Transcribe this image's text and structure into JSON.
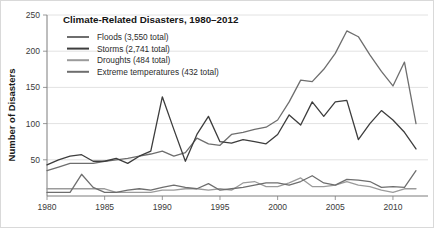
{
  "chart_data": {
    "type": "line",
    "title": "Climate-Related Disasters, 1980–2012",
    "xlabel": "",
    "ylabel": "Number of Disasters",
    "xlim": [
      1980,
      2012
    ],
    "ylim": [
      0,
      250
    ],
    "grid": true,
    "legend_position": "top-left",
    "x": [
      1980,
      1981,
      1982,
      1983,
      1984,
      1985,
      1986,
      1987,
      1988,
      1989,
      1990,
      1991,
      1992,
      1993,
      1994,
      1995,
      1996,
      1997,
      1998,
      1999,
      2000,
      2001,
      2002,
      2003,
      2004,
      2005,
      2006,
      2007,
      2008,
      2009,
      2010,
      2011,
      2012
    ],
    "x_ticks": [
      1980,
      1985,
      1990,
      1995,
      2000,
      2005,
      2010
    ],
    "y_ticks": [
      50,
      100,
      150,
      200,
      250
    ],
    "series": [
      {
        "name": "Floods",
        "label": "Floods (3,550 total)",
        "total": "3,550",
        "color": "#6e6e6e",
        "values": [
          35,
          40,
          45,
          45,
          45,
          48,
          50,
          52,
          55,
          58,
          62,
          55,
          60,
          80,
          72,
          70,
          85,
          88,
          92,
          95,
          105,
          130,
          160,
          158,
          175,
          197,
          228,
          220,
          195,
          172,
          152,
          185,
          100
        ]
      },
      {
        "name": "Storms",
        "label": "Storms (2,741 total)",
        "total": "2,741",
        "color": "#3d3d3d",
        "values": [
          43,
          50,
          55,
          57,
          48,
          48,
          52,
          45,
          55,
          62,
          137,
          92,
          48,
          85,
          110,
          75,
          73,
          78,
          75,
          72,
          85,
          112,
          98,
          130,
          110,
          130,
          132,
          78,
          100,
          118,
          105,
          88,
          65
        ]
      },
      {
        "name": "Droughts",
        "label": "Droughts (484 total)",
        "total": "484",
        "color": "#9b9b9b",
        "values": [
          10,
          10,
          10,
          10,
          10,
          10,
          5,
          5,
          5,
          5,
          8,
          8,
          10,
          10,
          8,
          10,
          8,
          18,
          20,
          13,
          13,
          18,
          25,
          13,
          13,
          15,
          20,
          15,
          13,
          8,
          5,
          10,
          10
        ]
      },
      {
        "name": "Extreme temperatures",
        "label": "Extreme temperatures (432 total)",
        "total": "432",
        "color": "#6e6e6e",
        "values": [
          5,
          5,
          5,
          30,
          12,
          5,
          5,
          8,
          10,
          8,
          12,
          15,
          12,
          10,
          17,
          8,
          10,
          12,
          15,
          18,
          18,
          15,
          20,
          28,
          18,
          15,
          23,
          22,
          20,
          12,
          13,
          12,
          35
        ]
      }
    ]
  }
}
